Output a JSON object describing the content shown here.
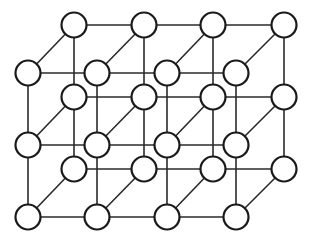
{
  "diagram": {
    "type": "crystal-lattice",
    "columns": 4,
    "rows": 3,
    "layers": 2,
    "front_layer": {
      "x": [
        28,
        97,
        167,
        236
      ],
      "y": [
        73,
        145,
        217
      ]
    },
    "back_layer": {
      "x": [
        74,
        144,
        213,
        284
      ],
      "y": [
        25,
        97,
        169
      ]
    },
    "node_radius": 12.5,
    "colors": {
      "node_fill": "#ffffff",
      "node_stroke": "#1a1a1a",
      "edge": "#2a2a2a",
      "background": "#ffffff"
    }
  }
}
